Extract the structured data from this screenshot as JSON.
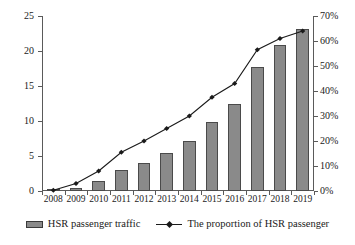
{
  "chart_data": {
    "type": "bar",
    "title": "",
    "xlabel": "",
    "ylabel": "",
    "categories": [
      "2008",
      "2009",
      "2010",
      "2011",
      "2012",
      "2013",
      "2014",
      "2015",
      "2016",
      "2017",
      "2018",
      "2019"
    ],
    "series": [
      {
        "name": "HSR passenger traffic",
        "type": "bar",
        "axis": "left",
        "values": [
          0.1,
          0.5,
          1.5,
          3.0,
          4.0,
          5.4,
          7.1,
          9.8,
          12.4,
          17.7,
          20.8,
          23.1
        ]
      },
      {
        "name": "The proportion of HSR passenger",
        "type": "line",
        "axis": "right",
        "values": [
          0.3,
          3.0,
          8.0,
          15.5,
          20.0,
          25.0,
          30.0,
          37.5,
          43.0,
          56.5,
          61.0,
          64.0
        ]
      }
    ],
    "ylim": [
      0,
      25
    ],
    "y2lim": [
      0,
      70
    ],
    "yticks": [
      "0",
      "5",
      "10",
      "15",
      "20",
      "25"
    ],
    "y2ticks": [
      "0%",
      "10%",
      "20%",
      "30%",
      "40%",
      "50%",
      "60%",
      "70%"
    ],
    "grid": false,
    "legend_position": "bottom"
  },
  "axes": {
    "left_ticks": [
      "25",
      "20",
      "15",
      "10",
      "5",
      "0"
    ],
    "right_ticks": [
      "70%",
      "60%",
      "50%",
      "40%",
      "30%",
      "20%",
      "10%",
      "0%"
    ],
    "x_ticks": [
      "2008",
      "2009",
      "2010",
      "2011",
      "2012",
      "2013",
      "2014",
      "2015",
      "2016",
      "2017",
      "2018",
      "2019"
    ]
  },
  "legend": {
    "items": [
      {
        "label": "HSR passenger traffic",
        "marker": "bar-swatch-icon",
        "color": "#8a8a8a"
      },
      {
        "label": "The proportion of HSR passenger",
        "marker": "line-diamond-marker-icon",
        "color": "#1a1a1a"
      }
    ]
  },
  "colors": {
    "bar_fill": "#8a8a8a",
    "bar_stroke": "#4a4a4a",
    "line": "#1a1a1a",
    "axis": "#5a5a5a",
    "background": "#ffffff"
  }
}
